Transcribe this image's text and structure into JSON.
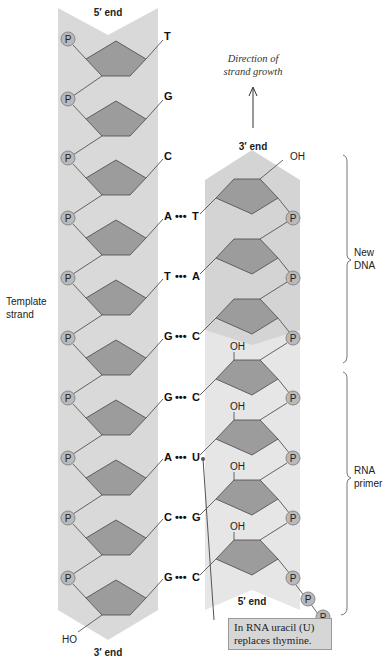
{
  "diagram": {
    "template_strand": {
      "label_line1": "Template",
      "label_line2": "strand",
      "top_end": "5′ end",
      "bottom_end": "3′ end",
      "bottom_terminal": "HO",
      "phosphate_label": "P",
      "bases": [
        "T",
        "G",
        "C",
        "A",
        "T",
        "G",
        "G",
        "A",
        "C",
        "G"
      ]
    },
    "new_strand": {
      "top_end": "3′ end",
      "bottom_end": "5′ end",
      "top_terminal": "OH",
      "paired_bases": [
        "T",
        "A",
        "C",
        "C",
        "U",
        "G",
        "C"
      ],
      "pairing_dots": "•••",
      "rna_oh_label": "OH",
      "phosphate_label": "P"
    },
    "direction": {
      "line1": "Direction of",
      "line2": "strand growth"
    },
    "brackets": {
      "new_dna_line1": "New",
      "new_dna_line2": "DNA",
      "rna_primer_line1": "RNA",
      "rna_primer_line2": "primer"
    },
    "note": {
      "line1": "In RNA uracil (U)",
      "line2": "replaces thymine."
    },
    "colors": {
      "strand_band": "#d9d9d9",
      "rna_band": "#e8e8e8",
      "sugar": "#9c9c9c",
      "phosphate": "#b9b9b9",
      "note_box": "#d6d6d6"
    }
  }
}
